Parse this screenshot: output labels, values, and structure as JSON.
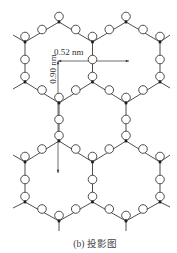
{
  "figure": {
    "caption": "(b) 投影图",
    "dimension_horizontal": "0.52 nm",
    "dimension_vertical": "0.90 nm"
  },
  "colors": {
    "line": "#3a3a3a",
    "atom_fill": "#ffffff",
    "center_dot": "#1e1e1e",
    "text": "#333333"
  },
  "lattice": {
    "vertex_circle_offset_y": -5.5,
    "edge_circle_offset_y": -2.5,
    "circle_radius": 4.3,
    "dot_radius": 1.5,
    "vertices": {
      "A1": [
        59,
        22
      ],
      "A2": [
        126,
        22
      ],
      "B1": [
        25,
        42
      ],
      "B2": [
        92.5,
        42
      ],
      "B3": [
        160,
        42
      ],
      "C1": [
        25,
        82
      ],
      "C2": [
        92.5,
        82
      ],
      "C3": [
        160,
        82
      ],
      "D1": [
        59,
        103
      ],
      "D2": [
        126,
        103
      ],
      "E1": [
        59,
        141
      ],
      "E2": [
        126,
        141
      ],
      "F1": [
        25,
        162
      ],
      "F2": [
        92.5,
        162
      ],
      "F3": [
        160,
        162
      ],
      "G1": [
        25,
        202
      ],
      "G2": [
        92.5,
        202
      ],
      "G3": [
        160,
        202
      ],
      "H1": [
        59,
        221
      ],
      "H2": [
        126,
        221
      ]
    },
    "edges": [
      [
        "A1",
        "B1"
      ],
      [
        "A1",
        "B2"
      ],
      [
        "A2",
        "B2"
      ],
      [
        "A2",
        "B3"
      ],
      [
        "B1",
        "C1"
      ],
      [
        "B2",
        "C2"
      ],
      [
        "B3",
        "C3"
      ],
      [
        "C1",
        "D1"
      ],
      [
        "C2",
        "D1"
      ],
      [
        "C2",
        "D2"
      ],
      [
        "C3",
        "D2"
      ],
      [
        "D1",
        "E1"
      ],
      [
        "D2",
        "E2"
      ],
      [
        "E1",
        "F1"
      ],
      [
        "E1",
        "F2"
      ],
      [
        "E2",
        "F2"
      ],
      [
        "E2",
        "F3"
      ],
      [
        "F1",
        "G1"
      ],
      [
        "F2",
        "G2"
      ],
      [
        "F3",
        "G3"
      ],
      [
        "G1",
        "H1"
      ],
      [
        "G2",
        "H1"
      ],
      [
        "G2",
        "H2"
      ],
      [
        "G3",
        "H2"
      ]
    ],
    "stubs": [
      [
        "B1",
        [
          13,
          35
        ]
      ],
      [
        "B3",
        [
          170,
          35
        ]
      ],
      [
        "C1",
        [
          13,
          89
        ]
      ],
      [
        "C3",
        [
          170,
          88
        ]
      ],
      [
        "F1",
        [
          13,
          155
        ]
      ],
      [
        "F3",
        [
          170,
          155
        ]
      ],
      [
        "G1",
        [
          13,
          208
        ]
      ],
      [
        "G3",
        [
          170,
          207
        ]
      ],
      [
        "H1",
        [
          59,
          231
        ]
      ],
      [
        "H2",
        [
          126,
          231
        ]
      ]
    ]
  },
  "dimensions": {
    "horizontal": {
      "from": [
        58,
        61
      ],
      "to": [
        129,
        61
      ]
    },
    "vertical": {
      "from": [
        58,
        61
      ],
      "to": [
        58,
        173
      ]
    }
  }
}
